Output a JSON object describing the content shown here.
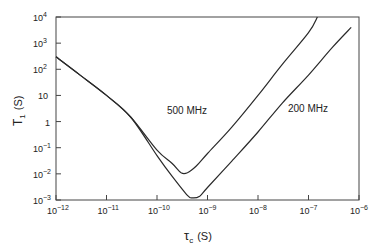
{
  "chart_data": {
    "type": "line",
    "title": "",
    "xlabel": "τc (S)",
    "ylabel": "T1 (S)",
    "xscale": "log",
    "yscale": "log",
    "xlim": [
      1e-12,
      1e-06
    ],
    "ylim": [
      0.001,
      10000.0
    ],
    "grid": false,
    "legend": "none (inline annotations)",
    "x_ticks": [
      {
        "base": "10",
        "exp": "−12",
        "value": 1e-12
      },
      {
        "base": "10",
        "exp": "−11",
        "value": 1e-11
      },
      {
        "base": "10",
        "exp": "−10",
        "value": 1e-10
      },
      {
        "base": "10",
        "exp": "−9",
        "value": 1e-09
      },
      {
        "base": "10",
        "exp": "−8",
        "value": 1e-08
      },
      {
        "base": "10",
        "exp": "−7",
        "value": 1e-07
      },
      {
        "base": "10",
        "exp": "−6",
        "value": 1e-06
      }
    ],
    "y_ticks": [
      {
        "base": "10",
        "exp": "4",
        "value": 10000.0
      },
      {
        "base": "10",
        "exp": "3",
        "value": 1000.0
      },
      {
        "base": "10",
        "exp": "2",
        "value": 100.0
      },
      {
        "base": "10",
        "exp": "",
        "value": 10
      },
      {
        "base": "1",
        "exp": "",
        "value": 1
      },
      {
        "base": "10",
        "exp": "−1",
        "value": 0.1
      },
      {
        "base": "10",
        "exp": "−2",
        "value": 0.01
      },
      {
        "base": "10",
        "exp": "−3",
        "value": 0.001
      }
    ],
    "series": [
      {
        "name": "500 MHz",
        "label_text": "500 MHz",
        "points": [
          [
            1e-12,
            300
          ],
          [
            3e-12,
            60
          ],
          [
            1e-11,
            10
          ],
          [
            3e-11,
            1.5
          ],
          [
            1e-10,
            0.08
          ],
          [
            2e-10,
            0.025
          ],
          [
            3e-10,
            0.011
          ],
          [
            4e-10,
            0.011
          ],
          [
            6e-10,
            0.02
          ],
          [
            1e-09,
            0.06
          ],
          [
            3e-09,
            0.6
          ],
          [
            1e-08,
            10
          ],
          [
            3e-08,
            150
          ],
          [
            1e-07,
            2500
          ],
          [
            1.5e-07,
            10000
          ]
        ]
      },
      {
        "name": "200 MHz",
        "label_text": "200 MHz",
        "points": [
          [
            1e-12,
            300
          ],
          [
            3e-12,
            60
          ],
          [
            1e-11,
            10
          ],
          [
            3e-11,
            1.5
          ],
          [
            1e-10,
            0.05
          ],
          [
            2e-10,
            0.008
          ],
          [
            4e-10,
            0.0015
          ],
          [
            5e-10,
            0.0012
          ],
          [
            7e-10,
            0.0014
          ],
          [
            1e-09,
            0.003
          ],
          [
            3e-09,
            0.03
          ],
          [
            1e-08,
            0.4
          ],
          [
            3e-08,
            5
          ],
          [
            1e-07,
            60
          ],
          [
            3e-07,
            700
          ],
          [
            7e-07,
            4000
          ]
        ]
      }
    ]
  },
  "axes": {
    "x_title": {
      "main": "τ",
      "sub": "c",
      "unit": "(S)"
    },
    "y_title": {
      "main": "T",
      "sub": "1",
      "unit": "(S)"
    }
  },
  "annotations": {
    "curve_500": "500 MHz",
    "curve_200": "200 MHz"
  },
  "colors": {
    "line": "#2a2a2a",
    "frame": "#444444",
    "background": "#ffffff"
  }
}
